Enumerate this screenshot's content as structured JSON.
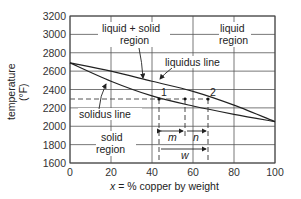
{
  "chart_data": {
    "type": "line",
    "title": "",
    "xlabel": "x = % copper by weight",
    "ylabel": "temperature (°F)",
    "xlim": [
      0,
      100
    ],
    "ylim": [
      1600,
      3200
    ],
    "x_ticks": [
      "0",
      "20",
      "40",
      "60",
      "80",
      "100"
    ],
    "y_ticks": [
      "1600",
      "1800",
      "2000",
      "2200",
      "2400",
      "2600",
      "2800",
      "3000",
      "3200"
    ],
    "grid": true,
    "series": [
      {
        "name": "liquidus line",
        "x": [
          0,
          20,
          40,
          60,
          80,
          100
        ],
        "y": [
          2690,
          2600,
          2490,
          2380,
          2230,
          2050
        ]
      },
      {
        "name": "solidus line",
        "x": [
          0,
          20,
          40,
          60,
          80,
          100
        ],
        "y": [
          2690,
          2490,
          2330,
          2220,
          2130,
          2050
        ]
      }
    ],
    "annotations": {
      "regions": [
        "liquid + solid region",
        "liquid region",
        "solid region"
      ],
      "lines": [
        "liquidus line",
        "solidus line"
      ],
      "points": [
        {
          "label": "1",
          "x": 43,
          "y": 2300
        },
        {
          "label": "2",
          "x": 67,
          "y": 2300
        }
      ],
      "reference_temperature": 2300,
      "mid_x": 56,
      "dimensions": [
        "m",
        "n",
        "w"
      ]
    }
  },
  "labels": {
    "ylabel_line1": "temperature",
    "ylabel_line2": "(°F)",
    "xlabel_var": "x",
    "xlabel_rest": " = % copper by weight",
    "liq_solid_1": "liquid + solid",
    "liq_solid_2": "region",
    "liquid_1": "liquid",
    "liquid_2": "region",
    "solid_1": "solid",
    "solid_2": "region",
    "liquidus": "liquidus line",
    "solidus": "solidus line",
    "p1": "1",
    "p2": "2",
    "m": "m",
    "n": "n",
    "w": "w"
  }
}
